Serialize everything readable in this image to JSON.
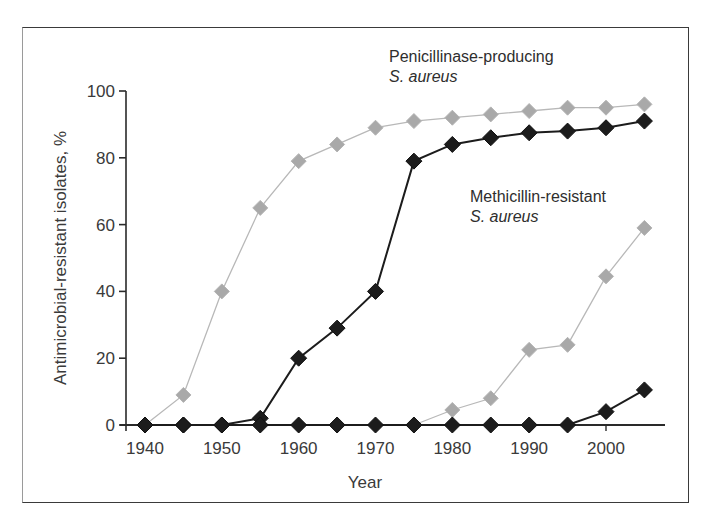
{
  "chart_data": {
    "type": "line",
    "title": "",
    "xlabel": "Year",
    "ylabel": "Antimicrobial-resistant isolates, %",
    "xlim": [
      1937,
      2008
    ],
    "ylim": [
      0,
      100
    ],
    "x_ticks": [
      1940,
      1950,
      1960,
      1970,
      1980,
      1990,
      2000
    ],
    "y_ticks": [
      0,
      20,
      40,
      60,
      80,
      100
    ],
    "grid": false,
    "legend": "none",
    "annotations": [
      {
        "line1": "Penicillinase-producing",
        "line2": "S. aureus",
        "placement": "top-center-right"
      },
      {
        "line1": "Methicillin-resistant",
        "line2": "S. aureus",
        "placement": "middle-right"
      }
    ],
    "series": [
      {
        "name": "Penicillinase-producing S. aureus (gray)",
        "group": "penicillinase",
        "color": "#a9a9a9",
        "line_color": "#b8b8b8",
        "x": [
          1940,
          1945,
          1950,
          1955,
          1960,
          1965,
          1970,
          1975,
          1980,
          1985,
          1990,
          1995,
          2000,
          2005
        ],
        "y": [
          0,
          9,
          40,
          65,
          79,
          84,
          89,
          91,
          92,
          93,
          94,
          95,
          95,
          96
        ]
      },
      {
        "name": "Penicillinase-producing S. aureus (black)",
        "group": "penicillinase",
        "color": "#1c1c1c",
        "line_color": "#1c1c1c",
        "x": [
          1940,
          1945,
          1950,
          1955,
          1960,
          1965,
          1970,
          1975,
          1980,
          1985,
          1990,
          1995,
          2000,
          2005
        ],
        "y": [
          0,
          0,
          0,
          2,
          20,
          29,
          40,
          79,
          84,
          86,
          87.5,
          88,
          89,
          91
        ]
      },
      {
        "name": "Methicillin-resistant S. aureus (gray)",
        "group": "methicillin",
        "color": "#a9a9a9",
        "line_color": "#b8b8b8",
        "x": [
          1975,
          1980,
          1985,
          1990,
          1995,
          2000,
          2005
        ],
        "y": [
          0,
          4.5,
          8,
          22.5,
          24,
          44.5,
          59
        ]
      },
      {
        "name": "Methicillin-resistant S. aureus (black)",
        "group": "methicillin",
        "color": "#1c1c1c",
        "line_color": "#1c1c1c",
        "x": [
          1940,
          1945,
          1950,
          1955,
          1960,
          1965,
          1970,
          1975,
          1980,
          1985,
          1990,
          1995,
          2000,
          2005
        ],
        "y": [
          0,
          0,
          0,
          0,
          0,
          0,
          0,
          0,
          0,
          0,
          0,
          0,
          4,
          10.5
        ]
      }
    ]
  }
}
